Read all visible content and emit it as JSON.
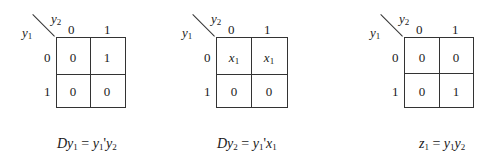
{
  "maps": [
    {
      "col_var": "y",
      "col_var_sub": "2",
      "row_var": "y",
      "row_var_sub": "1",
      "col_headers": [
        "0",
        "1"
      ],
      "row_headers": [
        "0",
        "1"
      ],
      "cells": [
        [
          "0",
          "1"
        ],
        [
          "0",
          "0"
        ]
      ],
      "equation": {
        "lhs": "Dy",
        "lhs_sub": "1",
        "eq": " = ",
        "t1": "y",
        "t1_sub": "1",
        "t1_suffix": "'",
        "t2": "y",
        "t2_sub": "2"
      }
    },
    {
      "col_var": "y",
      "col_var_sub": "2",
      "row_var": "y",
      "row_var_sub": "1",
      "col_headers": [
        "0",
        "1"
      ],
      "row_headers": [
        "0",
        "1"
      ],
      "cells": [
        [
          "x",
          "x"
        ],
        [
          "0",
          "0"
        ]
      ],
      "cell_subs": [
        [
          "1",
          "1"
        ],
        [
          "",
          ""
        ]
      ],
      "equation": {
        "lhs": "Dy",
        "lhs_sub": "2",
        "eq": " = ",
        "t1": "y",
        "t1_sub": "1",
        "t1_suffix": "'",
        "t2": "x",
        "t2_sub": "1"
      }
    },
    {
      "col_var": "y",
      "col_var_sub": "2",
      "row_var": "y",
      "row_var_sub": "1",
      "col_headers": [
        "0",
        "1"
      ],
      "row_headers": [
        "0",
        "1"
      ],
      "cells": [
        [
          "0",
          "0"
        ],
        [
          "0",
          "1"
        ]
      ],
      "equation": {
        "lhs": "z",
        "lhs_sub": "1",
        "eq": " = ",
        "t1": "y",
        "t1_sub": "1",
        "t1_suffix": "",
        "t2": "y",
        "t2_sub": "2"
      }
    }
  ]
}
